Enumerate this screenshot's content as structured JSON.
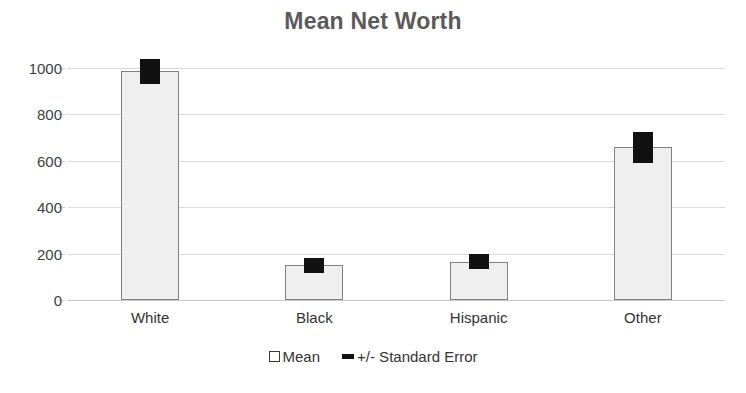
{
  "chart": {
    "title": "Mean Net Worth",
    "legend": {
      "mean_label": "Mean",
      "error_label": "+/- Standard Error"
    }
  },
  "chart_data": {
    "type": "bar",
    "title": "Mean Net Worth",
    "xlabel": "",
    "ylabel": "",
    "categories": [
      "White",
      "Black",
      "Hispanic",
      "Other"
    ],
    "values": [
      985,
      150,
      165,
      658
    ],
    "errors": [
      43,
      22,
      22,
      55
    ],
    "series": [
      {
        "name": "Mean",
        "values": [
          985,
          150,
          165,
          658
        ]
      },
      {
        "name": "+/- Standard Error",
        "values": [
          43,
          22,
          22,
          55
        ]
      }
    ],
    "ylim": [
      0,
      1000
    ],
    "yticks": [
      0,
      200,
      400,
      600,
      800,
      1000
    ],
    "ytick_labels": [
      "0",
      "200",
      "400",
      "600",
      "800",
      "1000"
    ],
    "grid": true,
    "legend_position": "bottom",
    "bar_fill_color": "#efefef",
    "bar_border_color": "#808080",
    "error_color": "#111111",
    "gridline_color": "#d9d9d9",
    "title_color": "#5a5a5a"
  }
}
